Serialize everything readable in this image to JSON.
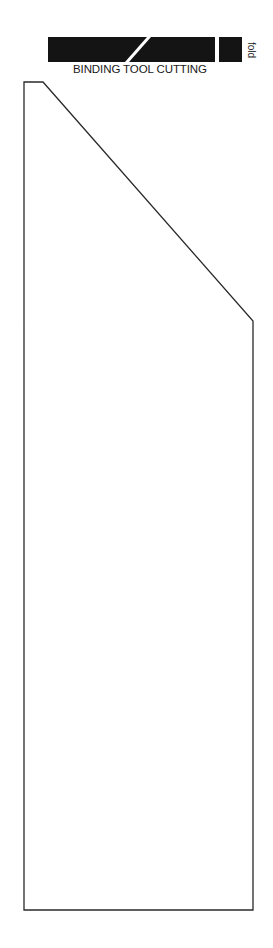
{
  "diagram": {
    "title": "BINDING TOOL CUTTING",
    "fold_label": "fold",
    "colors": {
      "bar": "#141414",
      "outline": "#2a2a2a",
      "background": "#ffffff"
    },
    "bar_segments": [
      {
        "name": "left-segment",
        "points": "48,37 147,37 125,62 48,62"
      },
      {
        "name": "middle-segment",
        "points": "151,37 215,37 215,62 129,62"
      },
      {
        "name": "right-segment",
        "points": "219,37 242,37 242,62 219,62"
      }
    ],
    "cut_outline": {
      "points": "24,82 43,82 253,321 253,910 24,910"
    }
  }
}
